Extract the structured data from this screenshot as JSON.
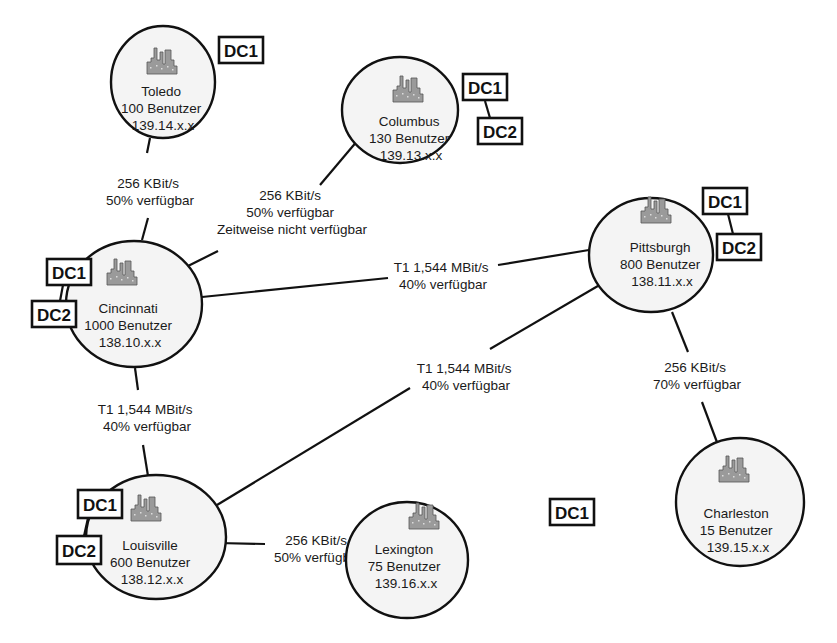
{
  "diagram": {
    "type": "network-topology",
    "sites": [
      {
        "id": "toledo",
        "name": "Toledo",
        "users": "100 Benutzer",
        "subnet": "139.14.x.x",
        "dcs": [
          "DC1"
        ]
      },
      {
        "id": "columbus",
        "name": "Columbus",
        "users": "130 Benutzer",
        "subnet": "139.13.x.x",
        "dcs": [
          "DC1",
          "DC2"
        ]
      },
      {
        "id": "cincinnati",
        "name": "Cincinnati",
        "users": "1000 Benutzer",
        "subnet": "138.10.x.x",
        "dcs": [
          "DC1",
          "DC2"
        ]
      },
      {
        "id": "pittsburgh",
        "name": "Pittsburgh",
        "users": "800 Benutzer",
        "subnet": "138.11.x.x",
        "dcs": [
          "DC1",
          "DC2"
        ]
      },
      {
        "id": "louisville",
        "name": "Louisville",
        "users": "600 Benutzer",
        "subnet": "138.12.x.x",
        "dcs": [
          "DC1",
          "DC2"
        ]
      },
      {
        "id": "lexington",
        "name": "Lexington",
        "users": "75 Benutzer",
        "subnet": "139.16.x.x",
        "dcs": [
          "DC1"
        ]
      },
      {
        "id": "charleston",
        "name": "Charleston",
        "users": "15 Benutzer",
        "subnet": "139.15.x.x",
        "dcs": []
      }
    ],
    "links": [
      {
        "from": "toledo",
        "to": "cincinnati",
        "lines": [
          "256 KBit/s",
          "50% verfügbar"
        ]
      },
      {
        "from": "columbus",
        "to": "cincinnati",
        "lines": [
          "256 KBit/s",
          "50% verfügbar",
          "Zeitweise nicht verfügbar"
        ]
      },
      {
        "from": "cincinnati",
        "to": "pittsburgh",
        "lines": [
          "T1 1,544 MBit/s",
          "40% verfügbar"
        ]
      },
      {
        "from": "louisville",
        "to": "pittsburgh",
        "lines": [
          "T1 1,544 MBit/s",
          "40% verfügbar"
        ]
      },
      {
        "from": "cincinnati",
        "to": "louisville",
        "lines": [
          "T1 1,544 MBit/s",
          "40% verfügbar"
        ]
      },
      {
        "from": "pittsburgh",
        "to": "charleston",
        "lines": [
          "256 KBit/s",
          "70% verfügbar"
        ]
      },
      {
        "from": "louisville",
        "to": "lexington",
        "lines": [
          "256 KBit/s",
          "50% verfügbar"
        ]
      }
    ],
    "icon": "city-skyline-icon",
    "colors": {
      "line": "#111111",
      "site_fill": "#f4f4f4",
      "icon_fill": "#9a9a9a"
    }
  }
}
